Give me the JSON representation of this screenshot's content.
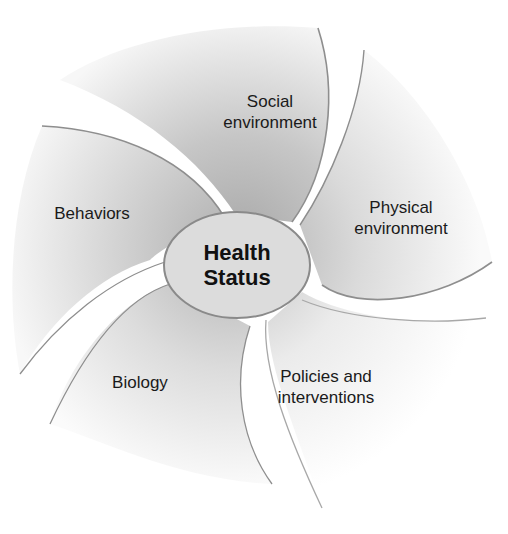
{
  "diagram": {
    "type": "pinwheel",
    "center": {
      "line1": "Health",
      "line2": "Status"
    },
    "blades": [
      {
        "id": "social",
        "line1": "Social",
        "line2": "environment"
      },
      {
        "id": "physical",
        "line1": "Physical",
        "line2": "environment"
      },
      {
        "id": "policies",
        "line1": "Policies and",
        "line2": "interventions"
      },
      {
        "id": "biology",
        "line1": "Biology",
        "line2": ""
      },
      {
        "id": "behaviors",
        "line1": "Behaviors",
        "line2": ""
      }
    ],
    "colors": {
      "blade_dark": "#a8a8a8",
      "blade_light": "#f6f6f6",
      "blade_stroke": "#8e8e8e",
      "center_fill": "#dcdcdc",
      "center_stroke": "#8a8a8a",
      "text": "#1a1a1a"
    }
  }
}
